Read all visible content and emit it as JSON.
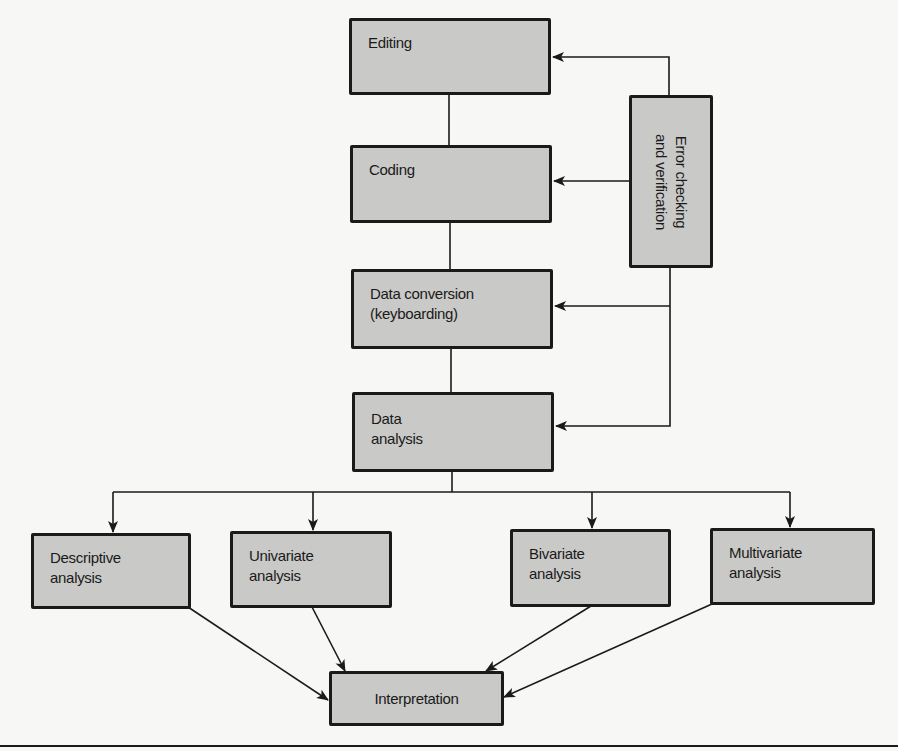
{
  "diagram": {
    "type": "flowchart",
    "nodes": {
      "editing": "Editing",
      "coding": "Coding",
      "data_conversion": "Data conversion\n(keyboarding)",
      "data_analysis": "Data\nanalysis",
      "error_checking": "Error checking\nand verification",
      "descriptive": "Descriptive\nanalysis",
      "univariate": "Univariate\nanalysis",
      "bivariate": "Bivariate\nanalysis",
      "multivariate": "Multivariate\nanalysis",
      "interpretation": "Interpretation"
    },
    "edges": [
      {
        "from": "editing",
        "to": "coding",
        "arrow": false
      },
      {
        "from": "coding",
        "to": "data_conversion",
        "arrow": false
      },
      {
        "from": "data_conversion",
        "to": "data_analysis",
        "arrow": false
      },
      {
        "from": "error_checking",
        "to": "editing",
        "arrow": true
      },
      {
        "from": "error_checking",
        "to": "coding",
        "arrow": true
      },
      {
        "from": "error_checking",
        "to": "data_conversion",
        "arrow": true
      },
      {
        "from": "error_checking",
        "to": "data_analysis",
        "arrow": true
      },
      {
        "from": "data_analysis",
        "to": "descriptive",
        "arrow": true
      },
      {
        "from": "data_analysis",
        "to": "univariate",
        "arrow": true
      },
      {
        "from": "data_analysis",
        "to": "bivariate",
        "arrow": true
      },
      {
        "from": "data_analysis",
        "to": "multivariate",
        "arrow": true
      },
      {
        "from": "descriptive",
        "to": "interpretation",
        "arrow": true
      },
      {
        "from": "univariate",
        "to": "interpretation",
        "arrow": true
      },
      {
        "from": "bivariate",
        "to": "interpretation",
        "arrow": true
      },
      {
        "from": "multivariate",
        "to": "interpretation",
        "arrow": true
      }
    ],
    "colors": {
      "box_fill": "#c9c9c7",
      "stroke": "#1a1a1a",
      "background": "#f7f7f5"
    }
  }
}
